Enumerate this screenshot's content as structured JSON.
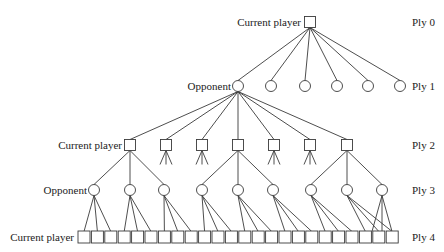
{
  "labels": {
    "root_player": "Current player",
    "ply1_player": "Opponent",
    "ply2_player": "Current player",
    "ply3_player": "Opponent",
    "ply4_player": "Current player"
  },
  "plies": [
    {
      "label": "Ply 0",
      "y": 22
    },
    {
      "label": "Ply 1",
      "y": 86
    },
    {
      "label": "Ply 2",
      "y": 145
    },
    {
      "label": "Ply 3",
      "y": 190
    },
    {
      "label": "Ply 4",
      "y": 237
    }
  ],
  "colors": {
    "stroke": "#3a3a3a",
    "text": "#222222",
    "background": "#ffffff"
  },
  "tree": {
    "root": {
      "x": 310,
      "y": 22,
      "shape": "square"
    },
    "ply1": {
      "shape": "circle",
      "y": 86,
      "xs": [
        238,
        271,
        305,
        337,
        368,
        400
      ],
      "expanded_index": 0
    },
    "ply2": {
      "shape": "square",
      "y": 145,
      "xs": [
        130,
        166,
        202,
        238,
        274,
        310,
        347
      ],
      "expanded_indices": [
        0,
        3,
        6
      ]
    },
    "ply3": {
      "shape": "circle",
      "y": 190,
      "xs": [
        94,
        130,
        164,
        202,
        238,
        273,
        311,
        347,
        382
      ]
    },
    "ply4": {
      "shape": "square",
      "y": 237,
      "x_start": 84,
      "pitch": 13.4,
      "count": 24
    }
  }
}
